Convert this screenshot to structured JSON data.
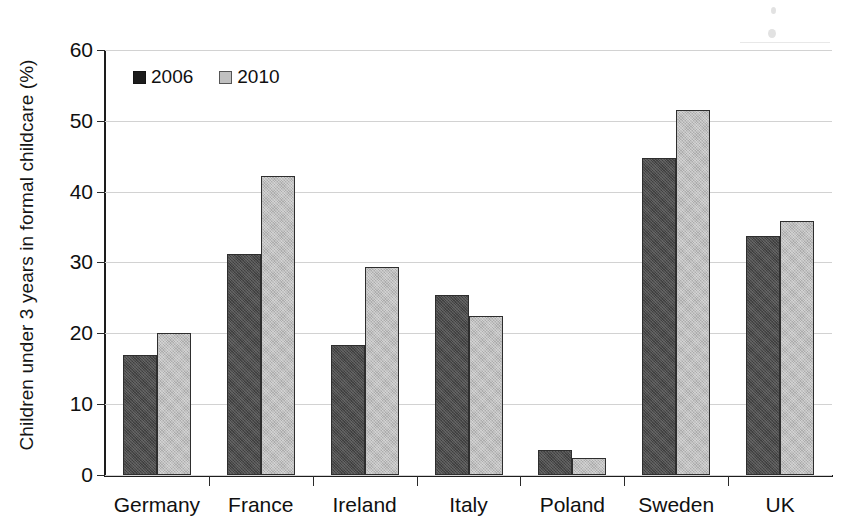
{
  "chart_data": {
    "type": "bar",
    "title": "",
    "xlabel": "",
    "ylabel": "Children under 3 years in formal childcare (%)",
    "ylim": [
      0,
      60
    ],
    "yticks": [
      0,
      10,
      20,
      30,
      40,
      50,
      60
    ],
    "grid": true,
    "legend_position": "top-left",
    "categories": [
      "Germany",
      "France",
      "Ireland",
      "Italy",
      "Poland",
      "Sweden",
      "UK"
    ],
    "series": [
      {
        "name": "2006",
        "color": "#4b4b4b",
        "values": [
          17.0,
          31.2,
          18.3,
          25.4,
          3.5,
          44.7,
          33.7
        ]
      },
      {
        "name": "2010",
        "color": "#bfbfbf",
        "values": [
          20.1,
          42.2,
          29.3,
          22.4,
          2.4,
          51.6,
          35.8
        ]
      }
    ]
  },
  "legend": {
    "items": [
      {
        "label": "2006",
        "swatch": "dark-square-marker"
      },
      {
        "label": "2010",
        "swatch": "light-square-marker"
      }
    ]
  },
  "axes": {
    "y_title": "Children under 3 years in formal childcare (%)",
    "y_tick_labels": [
      "0",
      "10",
      "20",
      "30",
      "40",
      "50",
      "60"
    ],
    "x_tick_labels": [
      "Germany",
      "France",
      "Ireland",
      "Italy",
      "Poland",
      "Sweden",
      "UK"
    ]
  }
}
